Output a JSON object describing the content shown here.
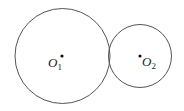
{
  "diagram": {
    "circles": [
      {
        "name": "circle-1",
        "center_label": "O",
        "subscript": "1",
        "cx": 62.5,
        "cy": 56,
        "r": 48
      },
      {
        "name": "circle-2",
        "center_label": "O",
        "subscript": "2",
        "cx": 140,
        "cy": 56,
        "r": 32
      }
    ],
    "stroke_color": "#555555",
    "point_color": "#111111"
  }
}
